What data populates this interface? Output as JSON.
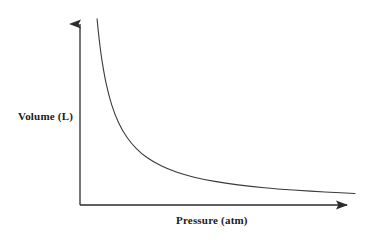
{
  "figure": {
    "background_color": "#ffffff",
    "line_color": "#3a3a3a",
    "axis_color": "#2b2b2b",
    "text_color": "#1a1a1a"
  },
  "chart_data": {
    "type": "line",
    "title": "",
    "subtitle": "",
    "xlabel": "Pressure (atm)",
    "ylabel": "Volume (L)",
    "relationship": "inverse proportion (V = k / P)",
    "grid": false,
    "legend": null,
    "axis_arrows": true,
    "tick_labels_x": [],
    "tick_labels_y": [],
    "xlim": [
      0,
      10
    ],
    "ylim": [
      0,
      10
    ],
    "x": [
      0.62,
      0.7,
      0.8,
      0.95,
      1.15,
      1.4,
      1.7,
      2.05,
      2.45,
      2.95,
      3.5,
      4.15,
      4.9,
      5.75,
      6.7,
      7.75,
      8.9,
      10.0
    ],
    "y": [
      9.7,
      8.6,
      7.52,
      6.33,
      5.23,
      4.3,
      3.54,
      2.94,
      2.46,
      2.04,
      1.72,
      1.45,
      1.23,
      1.05,
      0.9,
      0.78,
      0.68,
      0.6
    ]
  },
  "labels": {
    "y_axis": "Volume (L)",
    "x_axis": "Pressure (atm)"
  },
  "icons": {
    "y_axis_arrow": "arrow-up-icon",
    "x_axis_arrow": "arrow-right-icon"
  }
}
